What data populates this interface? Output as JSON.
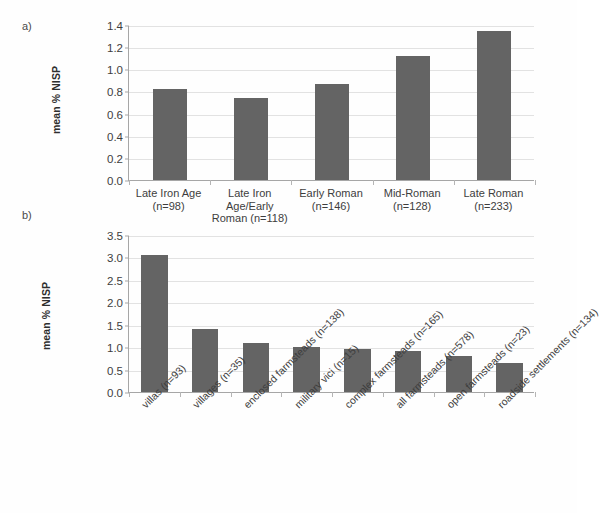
{
  "figure": {
    "panel_a_tag": "a)",
    "panel_b_tag": "b)"
  },
  "chart_data": [
    {
      "id": "panel_a",
      "type": "bar",
      "title": "",
      "xlabel": "",
      "ylabel": "mean % NISP",
      "ylim": [
        0.0,
        1.4
      ],
      "ytick_step": 0.2,
      "grid": true,
      "legend": "none",
      "bar_color": "#646464",
      "categories": [
        "Late Iron Age (n=98)",
        "Late Iron Age/Early Roman (n=118)",
        "Early Roman (n=146)",
        "Mid-Roman (n=128)",
        "Late Roman (n=233)"
      ],
      "category_lines": [
        [
          "Late Iron Age",
          "(n=98)"
        ],
        [
          "Late Iron",
          "Age/Early",
          "Roman (n=118)"
        ],
        [
          "Early Roman",
          "(n=146)"
        ],
        [
          "Mid-Roman",
          "(n=128)"
        ],
        [
          "Late Roman",
          "(n=233)"
        ]
      ],
      "values": [
        0.82,
        0.74,
        0.87,
        1.12,
        1.35
      ],
      "ytick_labels": [
        "0.0",
        "0.2",
        "0.4",
        "0.6",
        "0.8",
        "1.0",
        "1.2",
        "1.4"
      ]
    },
    {
      "id": "panel_b",
      "type": "bar",
      "title": "",
      "xlabel": "",
      "ylabel": "mean % NISP",
      "ylim": [
        0.0,
        3.5
      ],
      "ytick_step": 0.5,
      "grid": true,
      "legend": "none",
      "bar_color": "#646464",
      "categories": [
        "villas (n=93)",
        "villages (n=35)",
        "enclosed farmsteads (n=138)",
        "military vici (n=15)",
        "complex farmsteads (n=165)",
        "all farmsteads (n=578)",
        "open farmsteads (n=23)",
        "roadside settlements (n=134)"
      ],
      "values": [
        3.05,
        1.41,
        1.09,
        1.0,
        0.95,
        0.91,
        0.8,
        0.65
      ],
      "ytick_labels": [
        "0.0",
        "0.5",
        "1.0",
        "1.5",
        "2.0",
        "2.5",
        "3.0",
        "3.5"
      ]
    }
  ]
}
